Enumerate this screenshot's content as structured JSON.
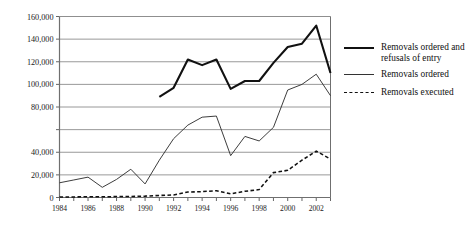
{
  "chart_data": {
    "type": "line",
    "title": "",
    "subtitle": "",
    "xlabel": "",
    "ylabel": "",
    "xlim": [
      1984,
      2003
    ],
    "ylim": [
      0,
      160000
    ],
    "grid": true,
    "grid_axis": "y",
    "legend_position": "right",
    "x": [
      1984,
      1985,
      1986,
      1987,
      1988,
      1989,
      1990,
      1991,
      1992,
      1993,
      1994,
      1995,
      1996,
      1997,
      1998,
      1999,
      2000,
      2001,
      2002,
      2003
    ],
    "xtick_labels": [
      "1984",
      "1986",
      "1988",
      "1990",
      "1992",
      "1994",
      "1996",
      "1998",
      "2000",
      "2002"
    ],
    "xtick_values": [
      1984,
      1986,
      1988,
      1990,
      1992,
      1994,
      1996,
      1998,
      2000,
      2002
    ],
    "ytick_labels": [
      "0",
      "20,000",
      "40,000",
      "80,000",
      "100,000",
      "120,000",
      "140,000",
      "160,000"
    ],
    "ytick_values": [
      0,
      20000,
      40000,
      80000,
      100000,
      120000,
      140000,
      160000
    ],
    "ygrid_values": [
      0,
      20000,
      40000,
      60000,
      80000,
      100000,
      120000,
      140000,
      160000
    ],
    "series": [
      {
        "name": "Removals ordered and refusals of entry",
        "style": "thick-solid",
        "color": "#111111",
        "x": [
          1991,
          1992,
          1993,
          1994,
          1995,
          1996,
          1997,
          1998,
          1999,
          2000,
          2001,
          2002,
          2003
        ],
        "values": [
          89000,
          97000,
          122000,
          117000,
          122000,
          96000,
          103000,
          103000,
          119000,
          133000,
          136000,
          152000,
          110000
        ]
      },
      {
        "name": "Removals ordered",
        "style": "thin-solid",
        "color": "#333333",
        "x": [
          1984,
          1985,
          1986,
          1987,
          1988,
          1989,
          1990,
          1991,
          1992,
          1993,
          1994,
          1995,
          1996,
          1997,
          1998,
          1999,
          2000,
          2001,
          2002,
          2003
        ],
        "values": [
          13000,
          15500,
          18000,
          9000,
          16000,
          25000,
          12000,
          33000,
          52000,
          64000,
          71000,
          72000,
          37000,
          54000,
          50000,
          62000,
          95000,
          100000,
          109000,
          90000
        ]
      },
      {
        "name": "Removals executed",
        "style": "dashed",
        "color": "#111111",
        "x": [
          1984,
          1985,
          1986,
          1987,
          1988,
          1989,
          1990,
          1991,
          1992,
          1993,
          1994,
          1995,
          1996,
          1997,
          1998,
          1999,
          2000,
          2001,
          2002,
          2003
        ],
        "values": [
          400,
          500,
          700,
          600,
          800,
          900,
          1200,
          1800,
          2200,
          4800,
          5200,
          6000,
          3200,
          5500,
          7000,
          22000,
          24000,
          33000,
          41000,
          34000
        ]
      }
    ]
  },
  "legend": {
    "items": [
      {
        "label": "Removals ordered and refusals of entry",
        "style": "thick-solid"
      },
      {
        "label": "Removals ordered",
        "style": "thin-solid"
      },
      {
        "label": "Removals executed",
        "style": "dashed"
      }
    ]
  }
}
